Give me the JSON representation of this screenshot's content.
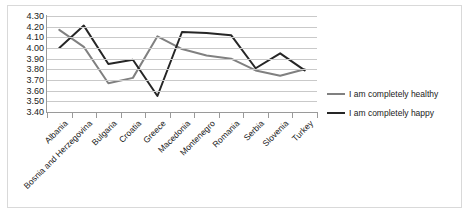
{
  "chart_data": {
    "type": "line",
    "title": "",
    "xlabel": "",
    "ylabel": "",
    "ylim": [
      3.4,
      4.3
    ],
    "ytick_step": 0.1,
    "grid": true,
    "legend_position": "right",
    "categories": [
      "Albania",
      "Bosnia and Herzegovina",
      "Bulgaria",
      "Croatia",
      "Greece",
      "Macedonia",
      "Montenegro",
      "Romania",
      "Serbia",
      "Slovenia",
      "Turkey"
    ],
    "ytick_labels": [
      "4.30",
      "4.20",
      "4.10",
      "4.00",
      "3.90",
      "3.80",
      "3.70",
      "3.60",
      "3.50",
      "3.40"
    ],
    "ytick_values": [
      4.3,
      4.2,
      4.1,
      4.0,
      3.9,
      3.8,
      3.7,
      3.6,
      3.5,
      3.4
    ],
    "series": [
      {
        "name": "I am completely healthy",
        "color": "#808080",
        "values": [
          4.17,
          4.01,
          3.67,
          3.72,
          4.11,
          3.99,
          3.93,
          3.9,
          3.79,
          3.74,
          3.8
        ]
      },
      {
        "name": "I am completely happy",
        "color": "#262626",
        "values": [
          4.0,
          4.21,
          3.85,
          3.89,
          3.55,
          4.15,
          4.14,
          4.12,
          3.81,
          3.95,
          3.79
        ]
      }
    ]
  },
  "legend": {
    "items": [
      {
        "label": "I am completely healthy",
        "color": "#808080"
      },
      {
        "label": "I am completely happy",
        "color": "#262626"
      }
    ]
  }
}
